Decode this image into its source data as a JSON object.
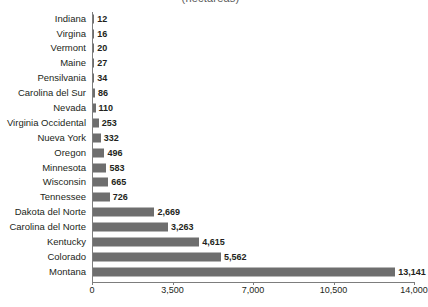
{
  "chart_data": {
    "type": "bar",
    "orientation": "horizontal",
    "title": "(hectáreas)",
    "xlabel": "",
    "ylabel": "",
    "xlim": [
      0,
      14000
    ],
    "grid": false,
    "legend": false,
    "categories": [
      "Indiana",
      "Virgina",
      "Vermont",
      "Maine",
      "Pensilvania",
      "Carolina del Sur",
      "Nevada",
      "Virginia Occidental",
      "Nueva York",
      "Oregon",
      "Minnesota",
      "Wisconsin",
      "Tennessee",
      "Dakota del Norte",
      "Carolina del Norte",
      "Kentucky",
      "Colorado",
      "Montana"
    ],
    "values": [
      12,
      16,
      20,
      27,
      34,
      86,
      110,
      253,
      332,
      496,
      583,
      665,
      726,
      2669,
      3263,
      4615,
      5562,
      13141
    ],
    "value_labels": [
      "12",
      "16",
      "20",
      "27",
      "34",
      "86",
      "110",
      "253",
      "332",
      "496",
      "583",
      "665",
      "726",
      "2,669",
      "3,263",
      "4,615",
      "5,562",
      "13,141"
    ],
    "xticks": [
      0,
      3500,
      7000,
      10500,
      14000
    ],
    "xtick_labels": [
      "0",
      "3,500",
      "7,000",
      "10,500",
      "14,000"
    ],
    "bar_color": "#6e6e6e",
    "axis_color": "#7d7d7d",
    "text_color": "#231f20",
    "background": "#ffffff"
  }
}
